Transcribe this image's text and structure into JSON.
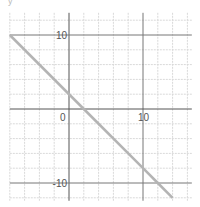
{
  "corner_label": "y",
  "chart_data": {
    "type": "line",
    "title": "",
    "xlabel": "",
    "ylabel": "",
    "xlim": [
      -8,
      16.6
    ],
    "ylim": [
      -12.4,
      13
    ],
    "grid": true,
    "major_grid_step": 10,
    "minor_grid_step": 2,
    "x_tick_labels": [
      {
        "value": 0,
        "label": "0"
      },
      {
        "value": 10,
        "label": "10"
      }
    ],
    "y_tick_labels": [
      {
        "value": 10,
        "label": "10"
      },
      {
        "value": -10,
        "label": "-10"
      }
    ],
    "series": [
      {
        "name": "y = -x + 2",
        "equation": "y = -x + 2",
        "color": "#b4b4b4",
        "x": [
          -8,
          2,
          10,
          12,
          14
        ],
        "y": [
          10,
          0,
          -8,
          -10,
          -12
        ]
      }
    ],
    "colors": {
      "axis": "#555555",
      "major_grid": "#777777",
      "minor_grid": "#d9d9d9",
      "line": "#b4b4b4"
    }
  }
}
